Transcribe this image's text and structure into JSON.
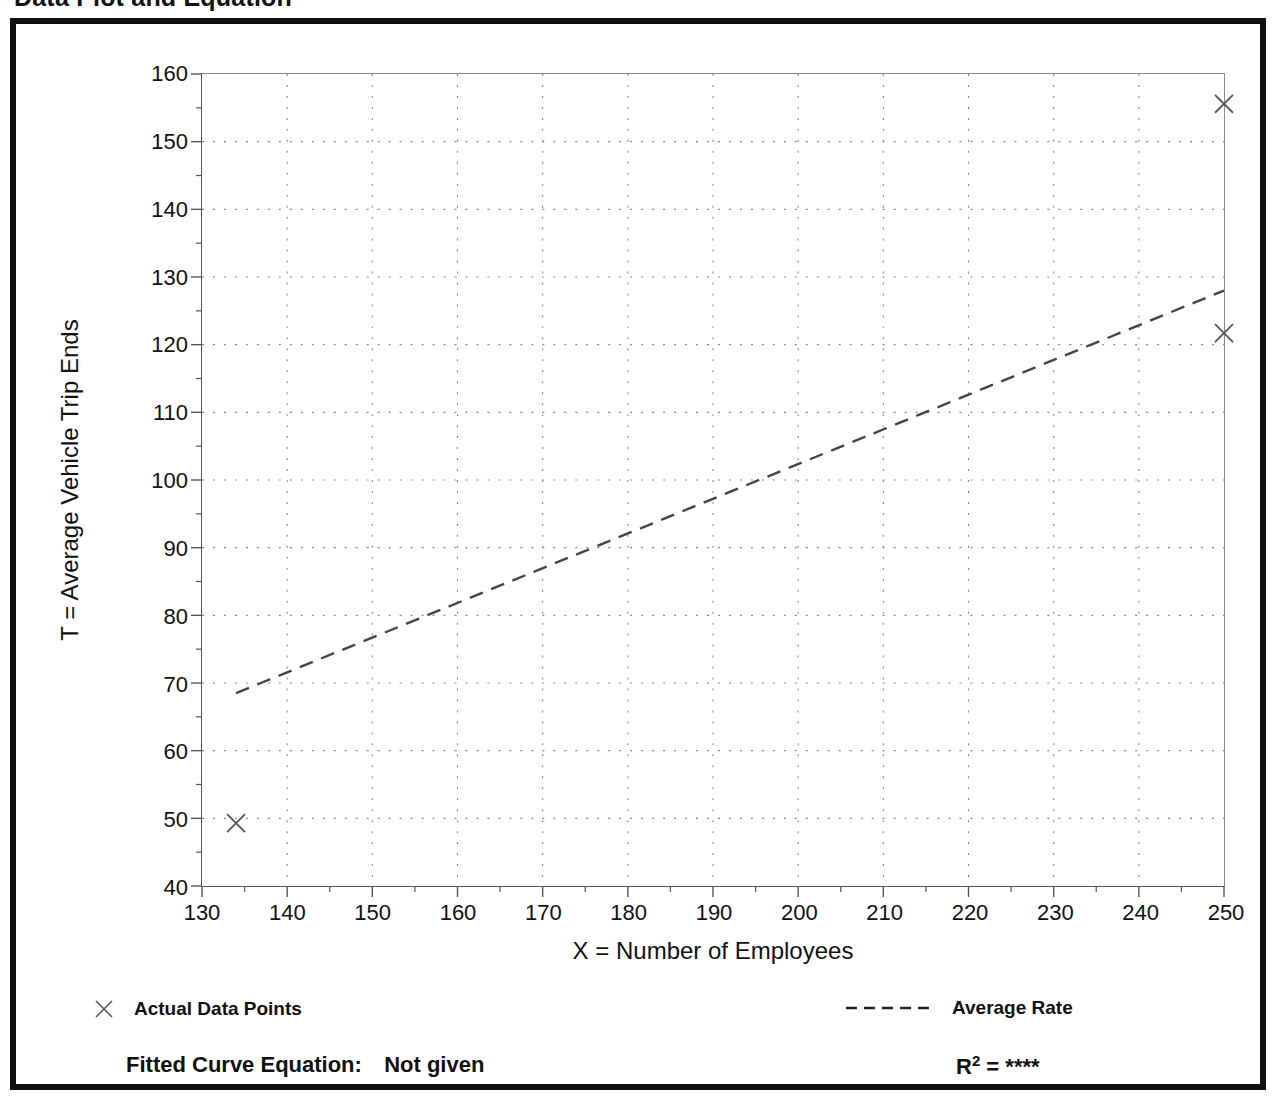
{
  "page_title": "Data Plot and Equation",
  "chart_data": {
    "type": "scatter",
    "title": "Data Plot and Equation",
    "xlabel": "X = Number of Employees",
    "ylabel": "T = Average Vehicle Trip Ends",
    "xlim": [
      130,
      250
    ],
    "ylim": [
      40,
      160
    ],
    "x_ticks": [
      130,
      140,
      150,
      160,
      170,
      180,
      190,
      200,
      210,
      220,
      230,
      240,
      250
    ],
    "y_ticks": [
      40,
      50,
      60,
      70,
      80,
      90,
      100,
      110,
      120,
      130,
      140,
      150,
      160
    ],
    "x_minor_step": 5,
    "y_minor_step": 5,
    "grid": true,
    "grid_style": "dotted",
    "legend_position": "below-plot",
    "series": [
      {
        "name": "Actual Data Points",
        "type": "scatter",
        "marker": "x",
        "points": [
          {
            "x": 134,
            "y": 49.3
          },
          {
            "x": 250,
            "y": 155.6
          },
          {
            "x": 250,
            "y": 121.7
          }
        ]
      },
      {
        "name": "Average Rate",
        "type": "line",
        "style": "dashed",
        "points": [
          {
            "x": 134,
            "y": 68.5
          },
          {
            "x": 250,
            "y": 128.0
          }
        ]
      }
    ]
  },
  "axes": {
    "y_title": "T = Average Vehicle Trip Ends",
    "x_title": "X = Number of Employees",
    "y_labels": [
      "160",
      "150",
      "140",
      "130",
      "120",
      "110",
      "100",
      "90",
      "80",
      "70",
      "60",
      "50",
      "40"
    ],
    "x_labels": [
      "130",
      "140",
      "150",
      "160",
      "170",
      "180",
      "190",
      "200",
      "210",
      "220",
      "230",
      "240",
      "250"
    ]
  },
  "legend": {
    "data_points_label": "Actual Data Points",
    "data_points_marker": "x-marker-icon",
    "average_rate_label": "Average Rate",
    "average_rate_marker": "dashed-line-icon"
  },
  "footer": {
    "fitted_equation_label": "Fitted Curve Equation:",
    "fitted_equation_value": "Not given",
    "r_squared_label": "R",
    "r_squared_exponent": "2",
    "r_squared_equals": "=",
    "r_squared_value": "****"
  },
  "colors": {
    "frame": "#111111",
    "axis": "#555555",
    "grid": "#888888",
    "series": "#444444",
    "background": "#ffffff"
  }
}
